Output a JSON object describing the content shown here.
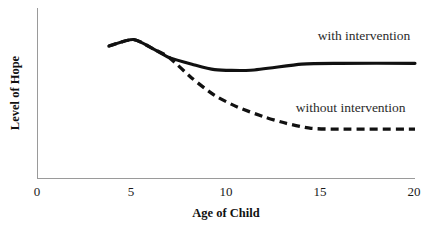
{
  "chart_data": {
    "type": "line",
    "title": "",
    "xlabel": "Age of Child",
    "ylabel": "Level of Hope",
    "xlim": [
      0,
      20
    ],
    "ylim": [
      0,
      10
    ],
    "grid": false,
    "legend_position": "inline-right",
    "xticks": [
      "0",
      "5",
      "10",
      "15",
      "20"
    ],
    "xtick_values": [
      0,
      5,
      10,
      15,
      20
    ],
    "yticks": [],
    "series": [
      {
        "name": "with intervention",
        "style": "solid",
        "color": "#111111",
        "label_x": 17.3,
        "label_y": 8.45,
        "x": [
          3.8,
          5.1,
          6.2,
          7.0,
          8.2,
          9.4,
          11.3,
          14.0,
          16.0,
          20.0
        ],
        "values": [
          8.05,
          8.45,
          7.85,
          7.35,
          6.95,
          6.62,
          6.58,
          6.95,
          7.0,
          7.0
        ]
      },
      {
        "name": "without intervention",
        "style": "dashed",
        "color": "#111111",
        "label_x": 16.6,
        "label_y": 4.05,
        "x": [
          3.8,
          5.1,
          6.2,
          7.0,
          8.2,
          9.4,
          10.6,
          12.0,
          13.2,
          14.5,
          16.0,
          20.0
        ],
        "values": [
          8.05,
          8.45,
          7.85,
          7.35,
          6.1,
          5.05,
          4.35,
          3.75,
          3.35,
          3.05,
          3.0,
          3.0
        ]
      }
    ]
  }
}
